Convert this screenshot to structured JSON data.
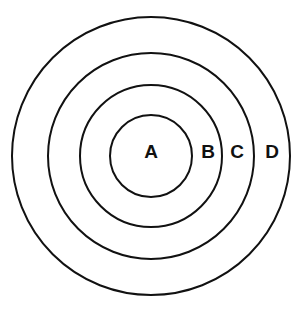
{
  "figure": {
    "kind": "concentric-circles-diagram",
    "background_color": "#ffffff",
    "stroke_color": "#111111",
    "label_color": "#111111",
    "width": 306,
    "height": 313,
    "center": {
      "x": 151,
      "y": 156
    }
  },
  "chart_data": {
    "type": "diagram",
    "title": "",
    "subtitle": "",
    "xlabel": "",
    "ylabel": "",
    "grid": false,
    "legend": "none",
    "shape": "concentric circles",
    "center": {
      "x": 151,
      "y": 156
    },
    "ring_count": 4,
    "labels": [
      "A",
      "B",
      "C",
      "D"
    ],
    "radii": [
      41,
      71,
      103,
      139
    ],
    "stroke_widths": [
      2,
      2,
      2,
      2
    ],
    "label_positions": [
      {
        "label": "A",
        "x": 151,
        "y": 153
      },
      {
        "label": "B",
        "x": 208,
        "y": 153
      },
      {
        "label": "C",
        "x": 237,
        "y": 153
      },
      {
        "label": "D",
        "x": 272,
        "y": 153
      }
    ],
    "rings": [
      {
        "label": "A",
        "radius": 41,
        "stroke_width": 2,
        "fill": "none",
        "stroke": "#111111"
      },
      {
        "label": "B",
        "radius": 71,
        "stroke_width": 2,
        "fill": "none",
        "stroke": "#111111"
      },
      {
        "label": "C",
        "radius": 103,
        "stroke_width": 2,
        "fill": "none",
        "stroke": "#111111"
      },
      {
        "label": "D",
        "radius": 139,
        "stroke_width": 2,
        "fill": "none",
        "stroke": "#111111"
      }
    ]
  }
}
